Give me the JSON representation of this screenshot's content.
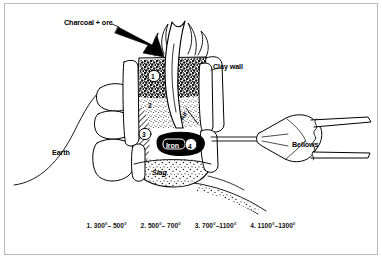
{
  "figure": {
    "labels": {
      "charcoal_ore": "Charcoal + ore",
      "clay_wall": "Clay wall",
      "bellows": "Bellows",
      "earth": "Earth",
      "slag": "Slag",
      "iron": "Iron",
      "air": "Air"
    },
    "zone_numbers": {
      "zone1": "1",
      "zone2": "2",
      "zone3": "3",
      "zone4": "4"
    },
    "colors": {
      "ink": "#000000",
      "paper": "#ffffff",
      "frame": "#b9b9b9"
    }
  },
  "legend": {
    "items": [
      {
        "index": "1.",
        "range": "300°– 500°",
        "text": "1.  300°– 500°"
      },
      {
        "index": "2.",
        "range": "500°– 700°",
        "text": "2.  500°– 700°"
      },
      {
        "index": "3.",
        "range": "700°–1100°",
        "text": "3.  700°–1100°"
      },
      {
        "index": "4.",
        "range": "1100°–1300°",
        "text": "4. 1100°–1300°"
      }
    ]
  }
}
